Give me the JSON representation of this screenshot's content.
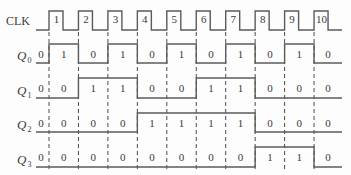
{
  "diagram": {
    "type": "timing-diagram",
    "clock": {
      "label": "CLK",
      "pulse_labels": [
        "1",
        "2",
        "3",
        "4",
        "5",
        "6",
        "7",
        "8",
        "9",
        "10"
      ]
    },
    "signals": [
      {
        "label": "Q",
        "subscript": "0",
        "values": [
          0,
          1,
          0,
          1,
          0,
          1,
          0,
          1,
          0,
          1,
          0
        ]
      },
      {
        "label": "Q",
        "subscript": "1",
        "values": [
          0,
          0,
          1,
          1,
          0,
          0,
          1,
          1,
          0,
          0,
          0
        ]
      },
      {
        "label": "Q",
        "subscript": "2",
        "values": [
          0,
          0,
          0,
          0,
          1,
          1,
          1,
          1,
          0,
          0,
          0
        ]
      },
      {
        "label": "Q",
        "subscript": "3",
        "values": [
          0,
          0,
          0,
          0,
          0,
          0,
          0,
          0,
          1,
          1,
          0
        ]
      }
    ],
    "colors": {
      "line": "#5b5b5b",
      "text": "#3a3a3a"
    }
  }
}
